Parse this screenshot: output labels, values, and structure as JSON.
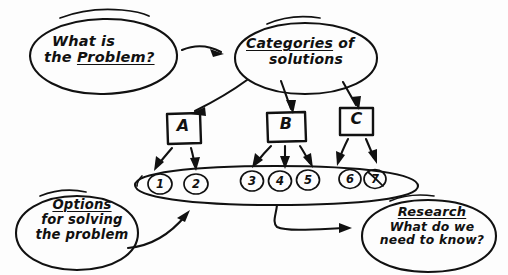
{
  "diagram": {
    "style": "hand-drawn sketch, black ink on white paper",
    "ink_color": "#111111",
    "paper_color": "#fdfdfd",
    "nodes": {
      "problem": {
        "shape": "ellipse",
        "line1": "What is",
        "line2_plain": "the ",
        "line2_underlined": "Problem?"
      },
      "categories": {
        "shape": "ellipse",
        "line1_underlined": "Categories",
        "line1_plain": " of",
        "line2": "solutions"
      },
      "box_a": {
        "shape": "rectangle",
        "label": "A"
      },
      "box_b": {
        "shape": "rectangle",
        "label": "B"
      },
      "box_c": {
        "shape": "rectangle",
        "label": "C"
      },
      "options": {
        "shape": "ellipse",
        "line1_underlined": "Options",
        "line2": "for solving",
        "line3": "the problem"
      },
      "research": {
        "shape": "ellipse",
        "line1_underlined": "Research",
        "line2": "What do we",
        "line3": "need to know?"
      },
      "solutions_band": {
        "shape": "long-ellipse",
        "items": [
          "1",
          "2",
          "3",
          "4",
          "5",
          "6",
          "7"
        ]
      }
    },
    "edges": [
      {
        "from": "problem",
        "to": "categories",
        "style": "curved-arrow"
      },
      {
        "from": "categories",
        "to": "box_a",
        "style": "arrow"
      },
      {
        "from": "categories",
        "to": "box_b",
        "style": "arrow"
      },
      {
        "from": "categories",
        "to": "box_c",
        "style": "arrow"
      },
      {
        "from": "box_a",
        "to": "item-1",
        "style": "arrow"
      },
      {
        "from": "box_a",
        "to": "item-2",
        "style": "arrow"
      },
      {
        "from": "box_b",
        "to": "item-3",
        "style": "arrow"
      },
      {
        "from": "box_b",
        "to": "item-4",
        "style": "arrow"
      },
      {
        "from": "box_b",
        "to": "item-5",
        "style": "arrow"
      },
      {
        "from": "box_c",
        "to": "item-6",
        "style": "arrow"
      },
      {
        "from": "box_c",
        "to": "item-7",
        "style": "arrow"
      },
      {
        "from": "options",
        "to": "solutions_band",
        "style": "curved-arrow"
      },
      {
        "from": "solutions_band",
        "to": "research",
        "style": "hooked-curved-arrow"
      }
    ]
  }
}
